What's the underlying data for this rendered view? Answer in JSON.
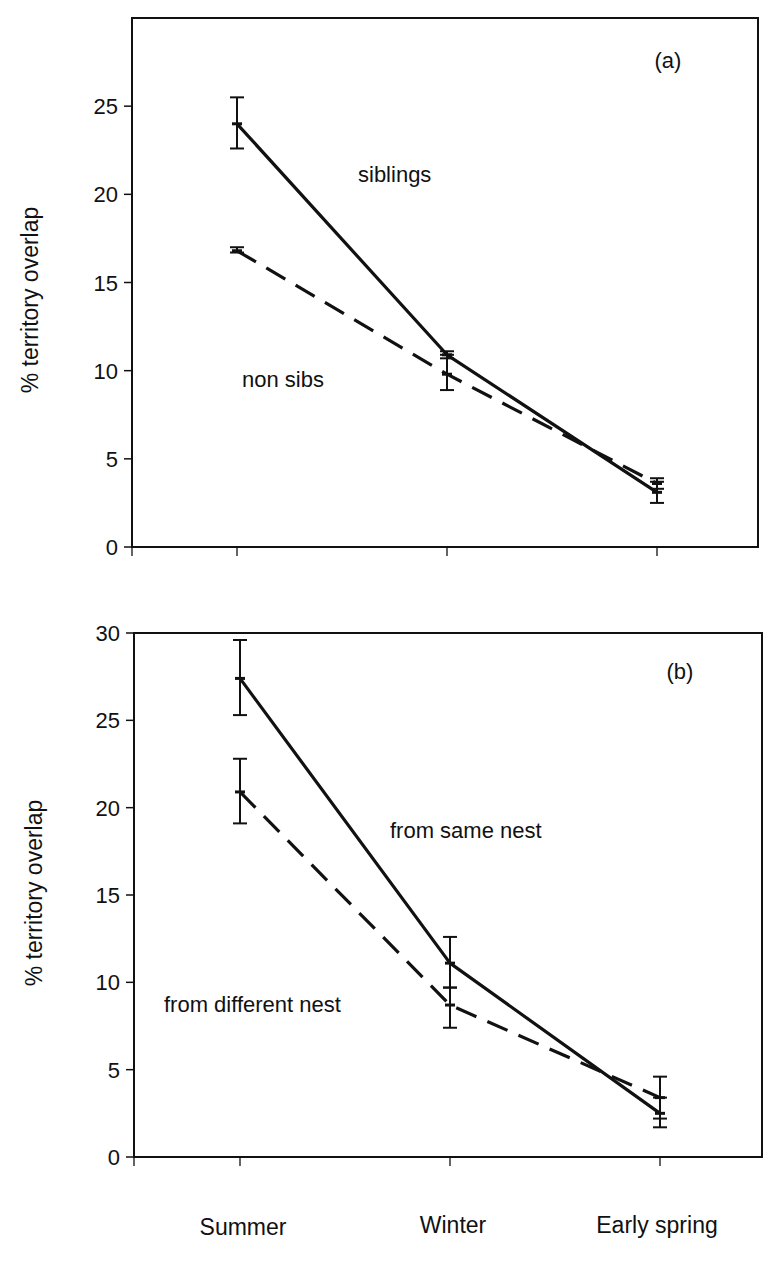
{
  "chart_data": [
    {
      "type": "line",
      "panel": "(a)",
      "title": "",
      "xlabel": "",
      "ylabel": "% territory overlap",
      "categories": [
        "Summer",
        "Winter",
        "Early spring"
      ],
      "ylim": [
        0,
        30
      ],
      "yticks": [
        0,
        5,
        10,
        15,
        20,
        25
      ],
      "grid": false,
      "legend": "inline annotations",
      "series": [
        {
          "name": "siblings",
          "style": "solid",
          "values": [
            24.0,
            10.9,
            3.1
          ],
          "err_low": [
            22.6,
            10.7,
            2.5
          ],
          "err_high": [
            25.5,
            11.1,
            3.7
          ]
        },
        {
          "name": "non sibs",
          "style": "dashed",
          "values": [
            16.8,
            9.8,
            3.6
          ],
          "err_low": [
            16.7,
            8.9,
            3.3
          ],
          "err_high": [
            17.0,
            10.9,
            3.9
          ]
        }
      ],
      "annotations": [
        "siblings",
        "non sibs",
        "(a)"
      ]
    },
    {
      "type": "line",
      "panel": "(b)",
      "title": "",
      "xlabel": "",
      "ylabel": "% territory overlap",
      "categories": [
        "Summer",
        "Winter",
        "Early spring"
      ],
      "ylim": [
        0,
        30
      ],
      "yticks": [
        0,
        5,
        10,
        15,
        20,
        25,
        30
      ],
      "grid": false,
      "legend": "inline annotations",
      "series": [
        {
          "name": "from same nest",
          "style": "solid",
          "values": [
            27.4,
            11.1,
            2.5
          ],
          "err_low": [
            25.3,
            9.7,
            1.7
          ],
          "err_high": [
            29.6,
            12.6,
            3.4
          ]
        },
        {
          "name": "from different nest",
          "style": "dashed",
          "values": [
            20.9,
            8.7,
            3.4
          ],
          "err_low": [
            19.1,
            7.4,
            2.2
          ],
          "err_high": [
            22.8,
            9.7,
            4.6
          ]
        }
      ],
      "annotations": [
        "from same nest",
        "from different nest",
        "(b)"
      ]
    }
  ],
  "panel_a": {
    "label": "(a)",
    "ylabel": "% territory overlap",
    "yticks": [
      "0",
      "5",
      "10",
      "15",
      "20",
      "25"
    ],
    "annot_series1": "siblings",
    "annot_series2": "non sibs"
  },
  "panel_b": {
    "label": "(b)",
    "ylabel": "% territory overlap",
    "yticks": [
      "0",
      "5",
      "10",
      "15",
      "20",
      "25",
      "30"
    ],
    "annot_series1": "from same nest",
    "annot_series2": "from different nest"
  },
  "x_categories": [
    "Summer",
    "Winter",
    "Early spring"
  ]
}
